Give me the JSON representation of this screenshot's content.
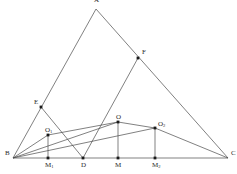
{
  "figure": {
    "type": "geometry-diagram",
    "width": 237,
    "height": 174,
    "background": "#ffffff",
    "stroke_color": "#4a4a4a",
    "point_color": "#1a1a1a",
    "label_color": "#2b2b2b",
    "stroke_width": 0.7
  },
  "points": [
    {
      "id": "A",
      "label": "A",
      "x": 96,
      "y": 9,
      "label_dx": -2,
      "label_dy": -8,
      "dot": false
    },
    {
      "id": "B",
      "label": "B",
      "x": 13,
      "y": 158,
      "label_dx": -8,
      "label_dy": -4,
      "dot": false
    },
    {
      "id": "C",
      "label": "C",
      "x": 228,
      "y": 158,
      "label_dx": 3,
      "label_dy": -4,
      "dot": false
    },
    {
      "id": "D",
      "label": "D",
      "x": 83,
      "y": 158,
      "label_dx": -2,
      "label_dy": 8,
      "dot": true
    },
    {
      "id": "E",
      "label": "E",
      "x": 41,
      "y": 107,
      "label_dx": -7,
      "label_dy": -4,
      "dot": true
    },
    {
      "id": "F",
      "label": "F",
      "x": 138,
      "y": 58,
      "label_dx": 4,
      "label_dy": -5,
      "dot": true
    },
    {
      "id": "M1",
      "label": "M",
      "sub": "1",
      "x": 48,
      "y": 158,
      "label_dx": -3,
      "label_dy": 8,
      "dot": true
    },
    {
      "id": "M",
      "label": "M",
      "x": 118,
      "y": 158,
      "label_dx": -3,
      "label_dy": 8,
      "dot": true
    },
    {
      "id": "M2",
      "label": "M",
      "sub": "2",
      "x": 155,
      "y": 158,
      "label_dx": -3,
      "label_dy": 8,
      "dot": true
    },
    {
      "id": "O1",
      "label": "O",
      "sub": "1",
      "x": 48,
      "y": 135,
      "label_dx": -3,
      "label_dy": -4,
      "dot": true
    },
    {
      "id": "O",
      "label": "O",
      "x": 118,
      "y": 122,
      "label_dx": -2,
      "label_dy": -4,
      "dot": true
    },
    {
      "id": "O2",
      "label": "O",
      "sub": "2",
      "x": 155,
      "y": 128,
      "label_dx": 3,
      "label_dy": -3,
      "dot": true
    }
  ],
  "segments": [
    {
      "name": "side-AB",
      "from": "A",
      "to": "B"
    },
    {
      "name": "side-AC",
      "from": "A",
      "to": "C"
    },
    {
      "name": "side-BC",
      "from": "B",
      "to": "C"
    },
    {
      "name": "cevian-DE",
      "from": "D",
      "to": "E"
    },
    {
      "name": "cevian-DF",
      "from": "D",
      "to": "F"
    },
    {
      "name": "perp-O1M1",
      "from": "O1",
      "to": "M1"
    },
    {
      "name": "perp-OM",
      "from": "O",
      "to": "M"
    },
    {
      "name": "perp-O2M2",
      "from": "O2",
      "to": "M2"
    },
    {
      "name": "chord-BO1",
      "from": "B",
      "to": "O1"
    },
    {
      "name": "chord-O1O",
      "from": "O1",
      "to": "O"
    },
    {
      "name": "chord-OO2",
      "from": "O",
      "to": "O2"
    },
    {
      "name": "chord-O2C",
      "from": "O2",
      "to": "C"
    },
    {
      "name": "chord-BO",
      "from": "B",
      "to": "O"
    },
    {
      "name": "chord-BO2-long",
      "from": "B",
      "to": "O2"
    }
  ],
  "labels": {
    "A": "A",
    "B": "B",
    "C": "C",
    "D": "D",
    "E": "E",
    "F": "F",
    "M": "M",
    "M1": "M",
    "M1_sub": "1",
    "M2": "M",
    "M2_sub": "2",
    "O": "O",
    "O1": "O",
    "O1_sub": "1",
    "O2": "O",
    "O2_sub": "2"
  }
}
